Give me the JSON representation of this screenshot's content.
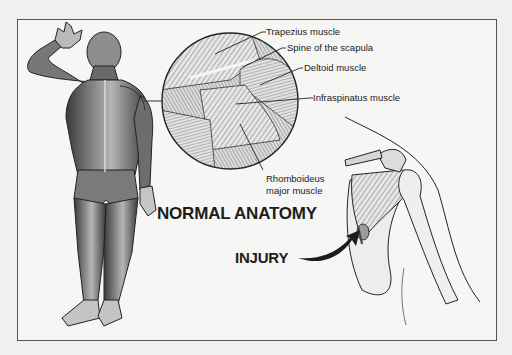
{
  "diagram": {
    "colors": {
      "background": "#f1f1ef",
      "panel": "#f6f6f4",
      "frame": "#555555",
      "ink": "#1c1c1c",
      "shade": "#6e6e6e"
    },
    "labels": {
      "trapezius": "Trapezius muscle",
      "spine_scapula": "Spine of the scapula",
      "deltoid": "Deltoid muscle",
      "infraspinatus": "Infraspinatus muscle",
      "rhomboideus_line1": "Rhomboideus",
      "rhomboideus_line2": "major muscle"
    },
    "headings": {
      "normal": "NORMAL ANATOMY",
      "injury": "INJURY"
    },
    "figures": [
      {
        "name": "full-body-posterior-muscle-view"
      },
      {
        "name": "magnified-shoulder-circle"
      },
      {
        "name": "injured-shoulder-joint"
      }
    ]
  }
}
